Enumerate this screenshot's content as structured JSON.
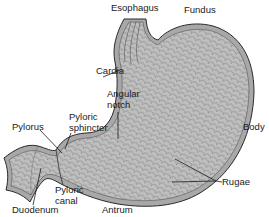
{
  "diagram": {
    "colors": {
      "tissue_fill": "#bdbdbd",
      "tissue_texture": "#8e8e8e",
      "outline": "#2a2a2a",
      "wall": "#a9a9a9",
      "label_text": "#1a1a1a",
      "background": "#ffffff"
    },
    "labels": {
      "esophagus": "Esophagus",
      "fundus": "Fundus",
      "cardia": "Cardia",
      "angular_notch_1": "Angular",
      "angular_notch_2": "notch",
      "body": "Body",
      "pyloric_sphincter_1": "Pyloric",
      "pyloric_sphincter_2": "sphincter",
      "pylorus": "Pylorus",
      "rugae": "Rugae",
      "pyloric_canal_1": "Pyloric",
      "pyloric_canal_2": "canal",
      "duodenum": "Duodenum",
      "antrum": "Antrum"
    }
  }
}
